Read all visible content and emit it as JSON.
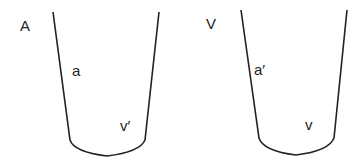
{
  "panels": [
    {
      "title": "A",
      "side_label": "a",
      "bottom_label": "v′"
    },
    {
      "title": "V",
      "side_label": "a′",
      "bottom_label": "v"
    }
  ],
  "colors": {
    "stroke": "#222222",
    "background": "#ffffff"
  }
}
